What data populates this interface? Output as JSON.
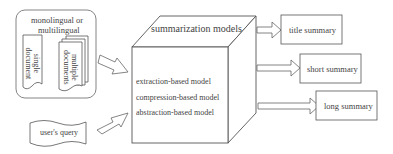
{
  "input_group": {
    "label_line1": "monolingual or",
    "label_line2": "multilingual",
    "single_doc_line1": "single",
    "single_doc_line2": "document",
    "multi_doc_line1": "multiple",
    "multi_doc_line2": "documents"
  },
  "query": {
    "label": "user's query"
  },
  "model_box": {
    "title": "summarization models",
    "models": [
      "extraction-based model",
      "compression-based model",
      "abstraction-based model"
    ]
  },
  "outputs": [
    "title summary",
    "short summary",
    "long summary"
  ],
  "colors": {
    "stroke": "#555555",
    "text": "#444444",
    "background": "#ffffff"
  }
}
